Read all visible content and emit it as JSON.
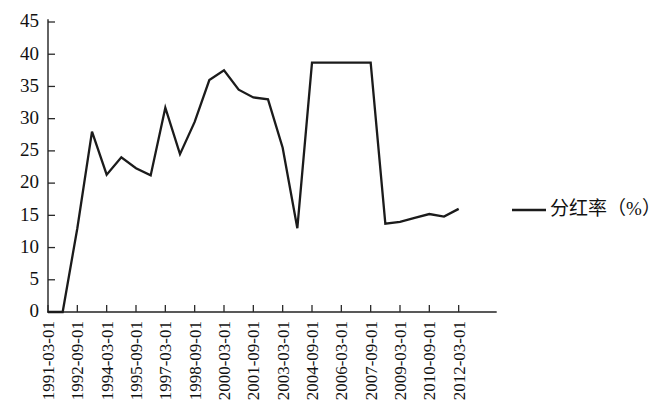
{
  "chart_data": {
    "type": "line",
    "title": "",
    "subtitle": "",
    "xlabel": "",
    "ylabel": "",
    "ylim": [
      0,
      45
    ],
    "yticks": [
      0,
      5,
      10,
      15,
      20,
      25,
      30,
      35,
      40,
      45
    ],
    "grid": false,
    "legend_position": "right",
    "legend": [
      "分红率（%）"
    ],
    "line_color": "#1b1b1b",
    "x_tick_labels": [
      "1991-03-01",
      "1992-09-01",
      "1994-03-01",
      "1995-09-01",
      "1997-03-01",
      "1998-09-01",
      "2000-03-01",
      "2001-09-01",
      "2003-03-01",
      "2004-09-01",
      "2006-03-01",
      "2007-09-01",
      "2009-03-01",
      "2010-09-01",
      "2012-03-01"
    ],
    "x": [
      "1991-03-01",
      "1991-12-01",
      "1992-09-01",
      "1993-06-01",
      "1994-03-01",
      "1994-12-01",
      "1995-09-01",
      "1996-06-01",
      "1997-03-01",
      "1997-12-01",
      "1998-09-01",
      "1999-06-01",
      "2000-03-01",
      "2000-12-01",
      "2001-09-01",
      "2002-06-01",
      "2003-03-01",
      "2003-12-01",
      "2004-09-01",
      "2005-06-01",
      "2006-03-01",
      "2006-12-01",
      "2007-09-01",
      "2008-06-01",
      "2009-03-01",
      "2009-12-01",
      "2010-09-01",
      "2011-06-01",
      "2012-03-01"
    ],
    "series": [
      {
        "name": "分红率（%）",
        "values": [
          0.0,
          0.0,
          13.0,
          28.0,
          21.3,
          24.0,
          22.3,
          21.2,
          31.7,
          24.5,
          29.5,
          36.0,
          37.5,
          34.5,
          33.3,
          33.0,
          25.5,
          13.0,
          38.7,
          38.7,
          38.7,
          38.7,
          38.7,
          13.7,
          14.0,
          14.6,
          15.2,
          14.8,
          16.0
        ]
      }
    ]
  }
}
